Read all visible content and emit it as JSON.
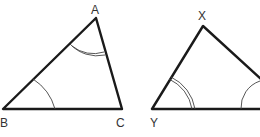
{
  "diagram": {
    "type": "similar-triangles",
    "triangles": [
      {
        "name": "ABC",
        "vertices": [
          {
            "label": "A",
            "x": 96,
            "y": 18
          },
          {
            "label": "B",
            "x": 3,
            "y": 109
          },
          {
            "label": "C",
            "x": 122,
            "y": 109
          }
        ],
        "angle_marks": [
          {
            "vertex": "A",
            "arcs": 2
          },
          {
            "vertex": "B",
            "arcs": 1
          }
        ]
      },
      {
        "name": "XYZ",
        "vertices": [
          {
            "label": "X",
            "x": 203,
            "y": 25
          },
          {
            "label": "Y",
            "x": 152,
            "y": 109
          },
          {
            "label": "",
            "x": 262,
            "y": 109
          }
        ],
        "angle_marks": [
          {
            "vertex": "Y",
            "arcs": 2
          },
          {
            "vertex": "right",
            "arcs": 1
          }
        ]
      }
    ],
    "labels": {
      "A": "A",
      "B": "B",
      "C": "C",
      "X": "X",
      "Y": "Y"
    },
    "colors": {
      "line": "#1a1a1a",
      "label": "#333333",
      "background": "#ffffff"
    }
  }
}
